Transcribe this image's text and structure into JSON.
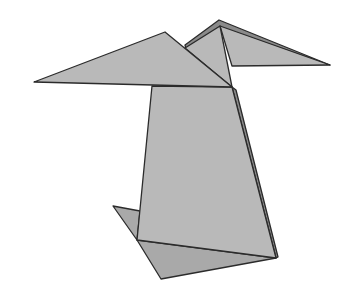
{
  "image": {
    "subject": "origami bird figure",
    "background": "#ffffff",
    "colors": {
      "paper": "#b9b9b9",
      "paper_dark": "#a9a9a9",
      "paper_shadow": "#8a8a8a",
      "edge": "#2b2b2b"
    },
    "parts": [
      {
        "name": "left-wing",
        "points": [
          [
            34,
            82
          ],
          [
            165,
            32
          ],
          [
            232,
            87
          ]
        ]
      },
      {
        "name": "back-ridge",
        "points": [
          [
            185,
            45
          ],
          [
            219,
            20
          ],
          [
            330,
            65
          ],
          [
            220,
            27
          ],
          [
            186,
            49
          ]
        ]
      },
      {
        "name": "middle-fold",
        "points": [
          [
            185,
            48
          ],
          [
            220,
            26
          ],
          [
            232,
            87
          ]
        ]
      },
      {
        "name": "right-wing",
        "points": [
          [
            220,
            26
          ],
          [
            330,
            65
          ],
          [
            232,
            66
          ]
        ]
      },
      {
        "name": "body",
        "points": [
          [
            152,
            86
          ],
          [
            232,
            87
          ],
          [
            276,
            258
          ],
          [
            137,
            240
          ]
        ]
      },
      {
        "name": "body-side",
        "points": [
          [
            232,
            87
          ],
          [
            236,
            90
          ],
          [
            278,
            257
          ],
          [
            276,
            258
          ]
        ]
      },
      {
        "name": "left-foot-flap",
        "points": [
          [
            113,
            206
          ],
          [
            140,
            211
          ],
          [
            137,
            240
          ]
        ]
      },
      {
        "name": "bottom-flap",
        "points": [
          [
            137,
            240
          ],
          [
            276,
            258
          ],
          [
            161,
            279
          ]
        ]
      }
    ]
  }
}
